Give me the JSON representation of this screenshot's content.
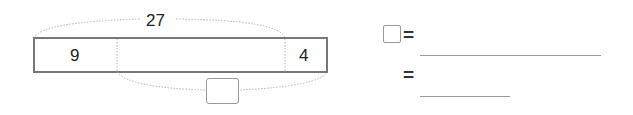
{
  "diagram": {
    "total_label": "27",
    "segments": [
      {
        "label": "9",
        "role": "known-part-left"
      },
      {
        "label": "",
        "role": "unknown-middle"
      },
      {
        "label": "4",
        "role": "known-part-right"
      }
    ],
    "bottom_answer_box": ""
  },
  "equations": [
    {
      "lhs_box": "",
      "equals": "=",
      "answer": ""
    },
    {
      "equals": "=",
      "answer": ""
    }
  ],
  "colors": {
    "bar_border": "#777777",
    "dotted": "#b5b5b5",
    "text": "#222222",
    "box_border": "#9a9a9a"
  }
}
